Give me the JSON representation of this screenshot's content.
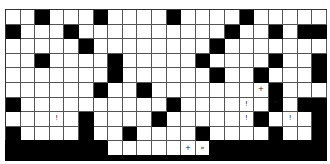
{
  "puzzle": {
    "type": "crossword-grid",
    "columns": 22,
    "rows": 10,
    "colors": {
      "black": "#000000",
      "white": "#ffffff",
      "grid_line": "#555555"
    },
    "grid": [
      "..#...#....#....#.....",
      "#...#..........#..#.##",
      ".....#........#.......",
      "..#....#.....#....#..#",
      ".......#......#..#...#",
      "......#..#........#...",
      "#..........#......#.##",
      ".....#....#......#...#",
      "#....#..#....#....#..#",
      "#######.....+»########"
    ],
    "marks": [
      {
        "row": 5,
        "col": 17,
        "text": "+"
      },
      {
        "row": 6,
        "col": 16,
        "text": "!"
      },
      {
        "row": 6,
        "col": 18,
        "text": "“"
      },
      {
        "row": 7,
        "col": 3,
        "text": "!"
      },
      {
        "row": 7,
        "col": 16,
        "text": "!"
      },
      {
        "row": 7,
        "col": 19,
        "text": "!"
      },
      {
        "row": 9,
        "col": 12,
        "text": "+"
      },
      {
        "row": 9,
        "col": 13,
        "text": "»"
      }
    ]
  }
}
